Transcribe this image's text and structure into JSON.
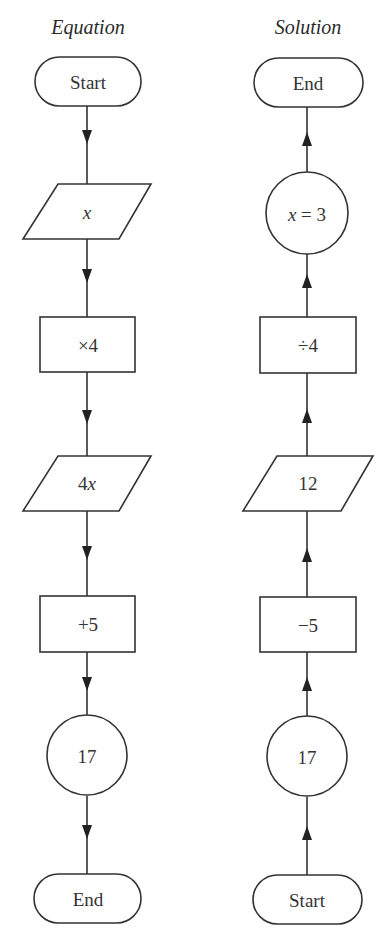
{
  "diagram": {
    "type": "flowchart",
    "colors": {
      "stroke": "#333333",
      "fill": "#ffffff",
      "text": "#333333"
    },
    "columns": [
      {
        "title": "Equation",
        "direction": "down",
        "nodes": [
          {
            "shape": "terminal",
            "label": "Start"
          },
          {
            "shape": "parallelogram",
            "label": "x",
            "italic": true
          },
          {
            "shape": "rectangle",
            "label": "×4"
          },
          {
            "shape": "parallelogram",
            "label": "4x",
            "italic": false
          },
          {
            "shape": "rectangle",
            "label": "+5"
          },
          {
            "shape": "circle",
            "label": "17"
          },
          {
            "shape": "terminal",
            "label": "End"
          }
        ]
      },
      {
        "title": "Solution",
        "direction": "up",
        "nodes": [
          {
            "shape": "terminal",
            "label": "End"
          },
          {
            "shape": "circle",
            "label": "x = 3"
          },
          {
            "shape": "rectangle",
            "label": "÷4"
          },
          {
            "shape": "parallelogram",
            "label": "12"
          },
          {
            "shape": "rectangle",
            "label": "−5"
          },
          {
            "shape": "circle",
            "label": "17"
          },
          {
            "shape": "terminal",
            "label": "Start"
          }
        ]
      }
    ]
  }
}
